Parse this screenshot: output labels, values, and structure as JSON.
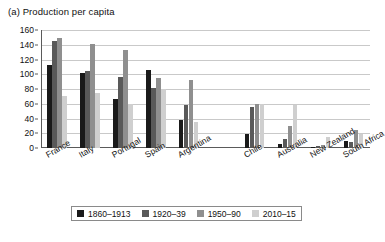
{
  "chart_data": {
    "type": "bar",
    "title": "(a) Production per capita",
    "xlabel": "",
    "ylabel": "",
    "ylim": [
      0,
      160
    ],
    "ytick_step": 20,
    "yticks": [
      0,
      20,
      40,
      60,
      80,
      100,
      120,
      140,
      160
    ],
    "grid": true,
    "legend_position": "bottom",
    "categories": [
      "France",
      "Italy",
      "Portugal",
      "Spain",
      "Argentina",
      "Chile",
      "Australia",
      "New Zealand",
      "South Africa"
    ],
    "group_gap_after": "Argentina",
    "series": [
      {
        "name": "1860–1913",
        "color": "#1a1a1a",
        "values": [
          113,
          102,
          67,
          106,
          38,
          19,
          6,
          2,
          10
        ]
      },
      {
        "name": "1920–39",
        "color": "#595959",
        "values": [
          145,
          105,
          96,
          82,
          59,
          55,
          12,
          3,
          8
        ]
      },
      {
        "name": "1950–90",
        "color": "#8f8f8f",
        "values": [
          149,
          141,
          133,
          95,
          92,
          60,
          30,
          4,
          25
        ]
      },
      {
        "name": "2010–15",
        "color": "#cfcfcf",
        "values": [
          71,
          75,
          60,
          80,
          35,
          60,
          58,
          15,
          19
        ]
      }
    ]
  },
  "colors": {
    "axis": "#5a5a5a",
    "grid": "#c9c9c9",
    "text": "#111111",
    "background": "#ffffff"
  }
}
